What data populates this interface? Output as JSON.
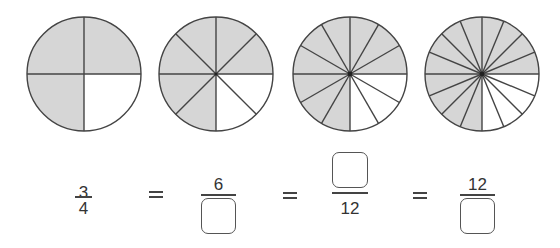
{
  "colors": {
    "shaded": "#d6d6d6",
    "unshaded": "#ffffff",
    "line": "#444444"
  },
  "circles": [
    {
      "divisions": 4,
      "shaded": 3,
      "label": "3/4 shaded"
    },
    {
      "divisions": 8,
      "shaded": 6,
      "label": "6/8 shaded"
    },
    {
      "divisions": 12,
      "shaded": 9,
      "label": "9/12 shaded"
    },
    {
      "divisions": 16,
      "shaded": 12,
      "label": "12/16 shaded"
    }
  ],
  "equation": {
    "fraction_1": {
      "numerator": "3",
      "denominator": "4"
    },
    "equals_1": "=",
    "fraction_2": {
      "numerator": "6",
      "denominator": ""
    },
    "equals_2": "=",
    "fraction_3": {
      "numerator": "",
      "denominator": "12"
    },
    "equals_3": "=",
    "fraction_4": {
      "numerator": "12",
      "denominator": ""
    }
  }
}
